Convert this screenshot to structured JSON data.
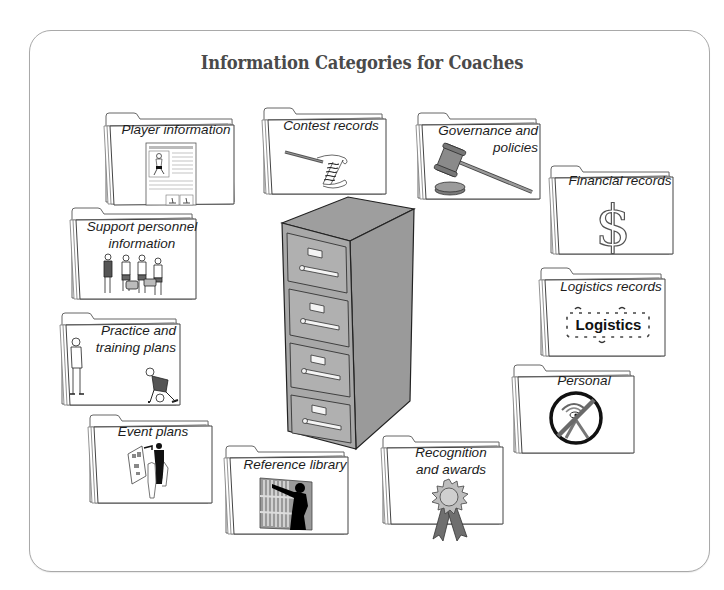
{
  "diagram": {
    "title": "Information Categories for Coaches",
    "center": {
      "name": "filing-cabinet",
      "drawers": 4
    },
    "colors": {
      "frame_border": "#a9a9a9",
      "title_text": "#4a4a4a",
      "cabinet_fill": "#a6a6a6",
      "cabinet_side": "#8e8e8e",
      "folder_outline": "#555555",
      "folder_fill": "#ffffff"
    },
    "folders": [
      {
        "id": "player",
        "label_lines": [
          "Player information"
        ],
        "icon": "player-profile-document-icon"
      },
      {
        "id": "contest",
        "label_lines": [
          "Contest records"
        ],
        "icon": "scroll-and-pen-icon"
      },
      {
        "id": "governance",
        "label_lines": [
          "Governance and",
          "policies"
        ],
        "icon": "gavel-icon"
      },
      {
        "id": "financial",
        "label_lines": [
          "Financial records"
        ],
        "icon": "dollar-sign-icon"
      },
      {
        "id": "support",
        "label_lines": [
          "Support personnel",
          "information"
        ],
        "icon": "staff-group-icon"
      },
      {
        "id": "logistics",
        "label_lines": [
          "Logistics records"
        ],
        "icon": "logistics-puzzle-icon",
        "icon_text": "Logistics"
      },
      {
        "id": "practice",
        "label_lines": [
          "Practice and",
          "training plans"
        ],
        "icon": "coach-and-athlete-icon"
      },
      {
        "id": "personal",
        "label_lines": [
          "Personal"
        ],
        "icon": "no-eye-prohibited-icon"
      },
      {
        "id": "event",
        "label_lines": [
          "Event plans"
        ],
        "icon": "planning-board-icon"
      },
      {
        "id": "reference",
        "label_lines": [
          "Reference library"
        ],
        "icon": "library-bookshelf-icon"
      },
      {
        "id": "recognition",
        "label_lines": [
          "Recognition",
          "and awards"
        ],
        "icon": "award-ribbon-icon"
      }
    ]
  }
}
